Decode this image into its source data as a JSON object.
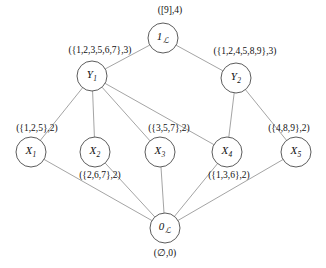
{
  "diagram": {
    "type": "hasse-lattice-diagram",
    "width": 326,
    "height": 268,
    "background_color": "#ffffff",
    "node_stroke_color": "#4a4a4a",
    "edge_stroke_color": "#8d8d8d",
    "text_color": "#111111",
    "nodes": [
      {
        "id": "top",
        "base": "1",
        "sub": "",
        "script": "ℒ",
        "cx": 163,
        "cy": 38,
        "r": 15
      },
      {
        "id": "y1",
        "base": "Y",
        "sub": "1",
        "script": "",
        "cx": 92,
        "cy": 76,
        "r": 15
      },
      {
        "id": "y2",
        "base": "Y",
        "sub": "2",
        "script": "",
        "cx": 236,
        "cy": 78,
        "r": 15
      },
      {
        "id": "x1",
        "base": "X",
        "sub": "1",
        "script": "",
        "cx": 31,
        "cy": 152,
        "r": 15
      },
      {
        "id": "x2",
        "base": "X",
        "sub": "2",
        "script": "",
        "cx": 95,
        "cy": 152,
        "r": 15
      },
      {
        "id": "x3",
        "base": "X",
        "sub": "3",
        "script": "",
        "cx": 160,
        "cy": 152,
        "r": 15
      },
      {
        "id": "x4",
        "base": "X",
        "sub": "4",
        "script": "",
        "cx": 227,
        "cy": 152,
        "r": 15
      },
      {
        "id": "x5",
        "base": "X",
        "sub": "5",
        "script": "",
        "cx": 296,
        "cy": 152,
        "r": 15
      },
      {
        "id": "bot",
        "base": "0",
        "sub": "",
        "script": "ℒ",
        "cx": 165,
        "cy": 228,
        "r": 15
      }
    ],
    "edges": [
      {
        "from": "y1",
        "to": "top"
      },
      {
        "from": "y2",
        "to": "top"
      },
      {
        "from": "x1",
        "to": "y1"
      },
      {
        "from": "x2",
        "to": "y1"
      },
      {
        "from": "x3",
        "to": "y1"
      },
      {
        "from": "x4",
        "to": "y1"
      },
      {
        "from": "x4",
        "to": "y2"
      },
      {
        "from": "x5",
        "to": "y2"
      },
      {
        "from": "bot",
        "to": "x1"
      },
      {
        "from": "bot",
        "to": "x2"
      },
      {
        "from": "bot",
        "to": "x3"
      },
      {
        "from": "bot",
        "to": "x4"
      },
      {
        "from": "bot",
        "to": "x5"
      }
    ],
    "annotations": [
      {
        "id": "annot-top",
        "text": "([9],4)",
        "x": 170,
        "y": 11
      },
      {
        "id": "annot-y1",
        "text": "({1,2,3,5,6,7},3)",
        "x": 100,
        "y": 51
      },
      {
        "id": "annot-y2",
        "text": "({1,2,4,5,8,9},3)",
        "x": 245,
        "y": 52
      },
      {
        "id": "annot-x1",
        "text": "({1,2,5},2)",
        "x": 37,
        "y": 129
      },
      {
        "id": "annot-x3",
        "text": "({3,5,7},2)",
        "x": 169,
        "y": 129
      },
      {
        "id": "annot-x5",
        "text": "({4,8,9},2)",
        "x": 289,
        "y": 129
      },
      {
        "id": "annot-x2",
        "text": "({2,6,7},2)",
        "x": 100,
        "y": 176
      },
      {
        "id": "annot-x4",
        "text": "({1,3,6},2)",
        "x": 229,
        "y": 176
      },
      {
        "id": "annot-bot",
        "text": "(∅,0)",
        "x": 165,
        "y": 254
      }
    ]
  }
}
